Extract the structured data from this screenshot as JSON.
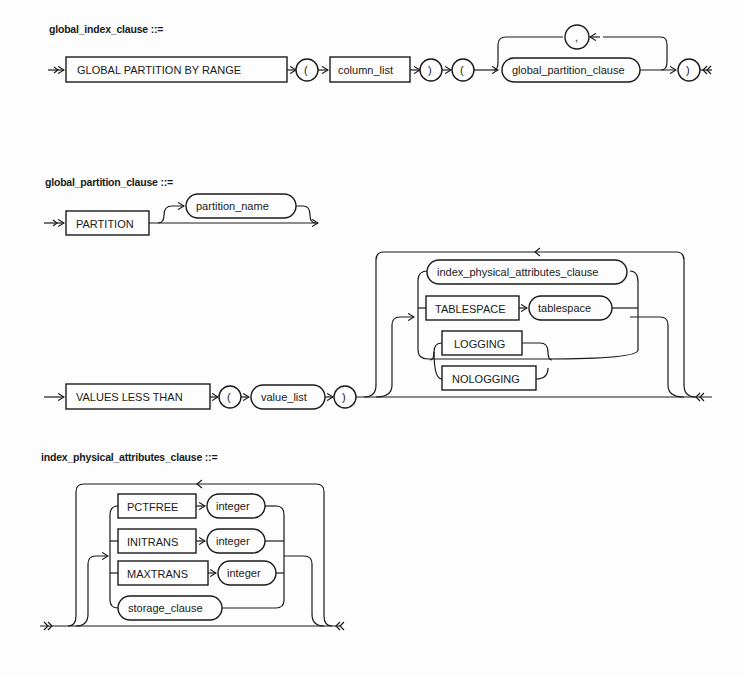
{
  "diagrams": [
    {
      "title": "global_index_clause ::=",
      "elements": [
        {
          "type": "keyword",
          "label": "GLOBAL PARTITION BY RANGE"
        },
        {
          "type": "symbol",
          "label": "("
        },
        {
          "type": "keyword",
          "label": "column_list"
        },
        {
          "type": "symbol",
          "label": ")"
        },
        {
          "type": "symbol",
          "label": "("
        },
        {
          "type": "nonterminal",
          "label": "global_partition_clause"
        },
        {
          "type": "symbol",
          "label": ","
        },
        {
          "type": "symbol",
          "label": ")"
        }
      ]
    },
    {
      "title": "global_partition_clause ::=",
      "elements": [
        {
          "type": "keyword",
          "label": "PARTITION"
        },
        {
          "type": "nonterminal",
          "label": "partition_name"
        },
        {
          "type": "keyword",
          "label": "VALUES LESS THAN"
        },
        {
          "type": "symbol",
          "label": "("
        },
        {
          "type": "nonterminal",
          "label": "value_list"
        },
        {
          "type": "symbol",
          "label": ")"
        },
        {
          "type": "nonterminal",
          "label": "index_physical_attributes_clause"
        },
        {
          "type": "keyword",
          "label": "TABLESPACE"
        },
        {
          "type": "nonterminal",
          "label": "tablespace"
        },
        {
          "type": "keyword",
          "label": "LOGGING"
        },
        {
          "type": "keyword",
          "label": "NOLOGGING"
        }
      ]
    },
    {
      "title": "index_physical_attributes_clause ::=",
      "elements": [
        {
          "type": "keyword",
          "label": "PCTFREE"
        },
        {
          "type": "nonterminal",
          "label": "integer"
        },
        {
          "type": "keyword",
          "label": "INITRANS"
        },
        {
          "type": "nonterminal",
          "label": "integer"
        },
        {
          "type": "keyword",
          "label": "MAXTRANS"
        },
        {
          "type": "nonterminal",
          "label": "integer"
        },
        {
          "type": "nonterminal",
          "label": "storage_clause"
        }
      ]
    }
  ]
}
